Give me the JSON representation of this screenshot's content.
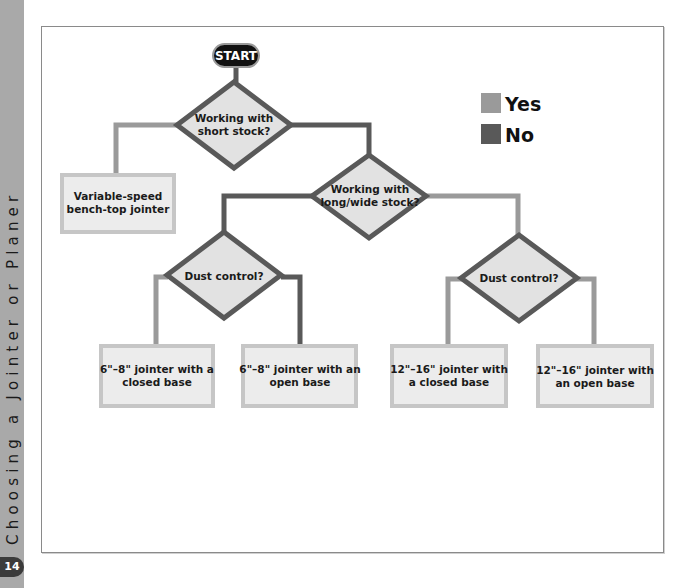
{
  "sidebar": {
    "running_title": "Choosing a Jointer or Planer",
    "page_number": "14"
  },
  "colors": {
    "yes": "#9a9a9a",
    "no": "#595959",
    "diamond_fill": "#e2e2e2",
    "box_fill": "#ececec",
    "box_border": "#c6c6c6",
    "start_fill": "#111111"
  },
  "legend": {
    "yes_label": "Yes",
    "no_label": "No"
  },
  "flowchart": {
    "start": {
      "label": "START"
    },
    "decisions": [
      {
        "id": "d1",
        "lines": [
          "Working with",
          "short stock?"
        ]
      },
      {
        "id": "d2",
        "lines": [
          "Working with",
          "long/wide stock?"
        ]
      },
      {
        "id": "d3",
        "lines": [
          "Dust control?"
        ]
      },
      {
        "id": "d4",
        "lines": [
          "Dust control?"
        ]
      }
    ],
    "outcomes": [
      {
        "id": "o1",
        "lines": [
          "Variable-speed",
          "bench-top jointer"
        ]
      },
      {
        "id": "o2",
        "lines": [
          "6\"–8\" jointer with a",
          "closed base"
        ]
      },
      {
        "id": "o3",
        "lines": [
          "6\"–8\" jointer with an",
          "open base"
        ]
      },
      {
        "id": "o4",
        "lines": [
          "12\"–16\" jointer with",
          "a closed base"
        ]
      },
      {
        "id": "o5",
        "lines": [
          "12\"–16\" jointer with",
          "an open base"
        ]
      }
    ],
    "edges": [
      {
        "from": "start",
        "to": "d1",
        "type": "no"
      },
      {
        "from": "d1",
        "to": "o1",
        "type": "yes"
      },
      {
        "from": "d1",
        "to": "d2",
        "type": "no"
      },
      {
        "from": "d2",
        "to": "d3",
        "type": "no"
      },
      {
        "from": "d2",
        "to": "d4",
        "type": "yes"
      },
      {
        "from": "d3",
        "to": "o2",
        "type": "yes"
      },
      {
        "from": "d3",
        "to": "o3",
        "type": "no"
      },
      {
        "from": "d4",
        "to": "o4",
        "type": "yes"
      },
      {
        "from": "d4",
        "to": "o5",
        "type": "yes"
      }
    ]
  }
}
